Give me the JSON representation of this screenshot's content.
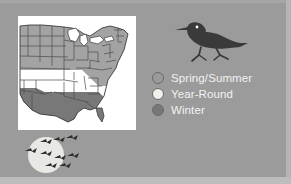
{
  "figure": {
    "name": "bird-range-map-figure",
    "background_color": "#9b9b9b",
    "width": 291,
    "height": 184
  },
  "map": {
    "name": "united-states-range-map",
    "region": "Eastern and Central United States",
    "background_color": "#ffffff",
    "border_color": "#4a4a4a",
    "bands": [
      {
        "id": "spring-summer",
        "label": "Spring/Summer",
        "color": "#a3a3a3",
        "area": "Northern states"
      },
      {
        "id": "year-round",
        "label": "Year-Round",
        "color": "#ffffff",
        "area": "Central band"
      },
      {
        "id": "winter",
        "label": "Winter",
        "color": "#787878",
        "area": "Gulf Coast and Deep South"
      }
    ]
  },
  "bird": {
    "name": "shorebird-silhouette",
    "color": "#3a3a3a",
    "eye_color": "#ffffff"
  },
  "legend": {
    "name": "range-legend",
    "text_color": "#f2f2f2",
    "outline_color": "#6a6a6a",
    "items": [
      {
        "label": "Spring/Summer",
        "color": "#9b9b9b"
      },
      {
        "label": "Year-Round",
        "color": "#f0f0ec"
      },
      {
        "label": "Winter",
        "color": "#787878"
      }
    ]
  },
  "migration": {
    "name": "migrating-flock-scene",
    "moon_color": "#e8e8e4",
    "bird_color": "#2e2e2e",
    "bird_count": 8
  }
}
